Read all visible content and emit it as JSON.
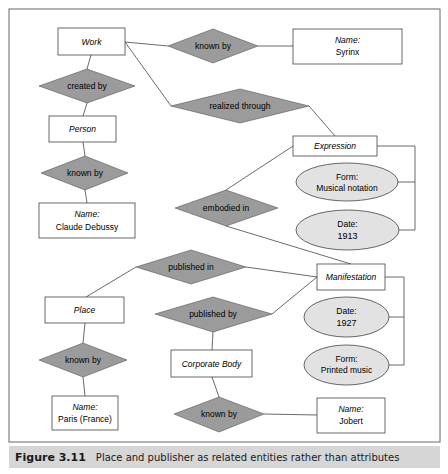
{
  "colors": {
    "relationship_fill": "#9b9b9b",
    "attribute_fill": "#e2e2e2",
    "entity_fill": "#ffffff",
    "stroke": "#444444",
    "caption_bg": "#d6d6d6"
  },
  "entities": {
    "work": "Work",
    "person": "Person",
    "name_debussy_label": "Name:",
    "name_debussy_value": "Claude Debussy",
    "name_syrinx_label": "Name:",
    "name_syrinx_value": "Syrinx",
    "expression": "Expression",
    "manifestation": "Manifestation",
    "place": "Place",
    "corporate_body": "Corporate Body",
    "name_paris_label": "Name:",
    "name_paris_value": "Paris (France)",
    "name_jobert_label": "Name:",
    "name_jobert_value": "Jobert"
  },
  "relationships": {
    "work_known_by": "known by",
    "created_by": "created by",
    "person_known_by": "known by",
    "realized_through": "realized through",
    "embodied_in": "embodied in",
    "published_in": "published in",
    "published_by": "published by",
    "place_known_by": "known by",
    "corp_known_by": "known by"
  },
  "attributes": {
    "expr_form_label": "Form:",
    "expr_form_value": "Musical notation",
    "expr_date_label": "Date:",
    "expr_date_value": "1913",
    "manif_date_label": "Date:",
    "manif_date_value": "1927",
    "manif_form_label": "Form:",
    "manif_form_value": "Printed music"
  },
  "caption": {
    "figure_number": "Figure 3.11",
    "text": "Place and publisher as related entities rather than attributes"
  }
}
